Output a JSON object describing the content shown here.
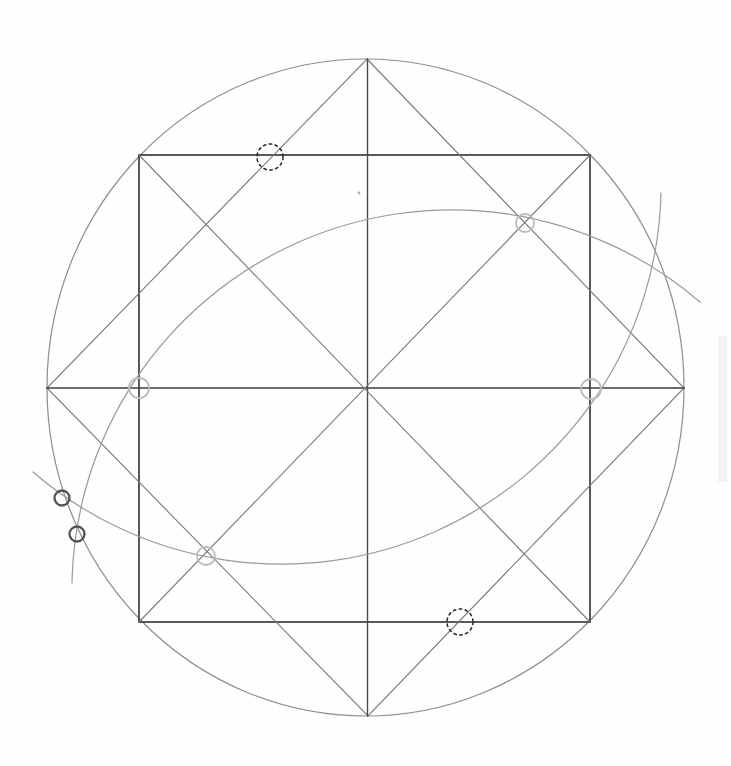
{
  "meta": {
    "canvas": {
      "width": 731,
      "height": 766,
      "background": "#fefefe"
    }
  },
  "palette": {
    "square_stroke": "#3c3c3c",
    "diameter_stroke": "#454545",
    "diagonal_stroke": "#7a7a7a",
    "circle_stroke": "#8e8e8e",
    "arc_stroke": "#9a9a9a",
    "dotted_marker": "#2a2a2a",
    "gray_marker": "#bcbcbc",
    "dark_marker": "#515151",
    "stray_dot": "#b0b0b0",
    "scan_streak": "#dcdcdc"
  },
  "diagram": {
    "outer_circle": {
      "name": "outer-circle",
      "cx": 365.5,
      "cy": 387.5,
      "rx": 318.5,
      "ry": 328.5,
      "stroke": "#8e8e8e",
      "width": 1.2
    },
    "inscribed_square": {
      "name": "inscribed-square",
      "x": 139,
      "y": 155,
      "w": 451,
      "h": 467,
      "stroke": "#3c3c3c",
      "width": 1.7
    },
    "diamond": {
      "name": "inscribed-diamond",
      "points": [
        [
          367,
          59
        ],
        [
          684,
          388
        ],
        [
          368,
          716
        ],
        [
          47,
          388
        ]
      ],
      "stroke": "#7a7a7a",
      "width": 1.1
    },
    "lines": [
      {
        "name": "vertical-diameter",
        "x1": 367.5,
        "y1": 59,
        "x2": 367.5,
        "y2": 716,
        "stroke": "#4a4a4a",
        "width": 1.4
      },
      {
        "name": "horizontal-diameter",
        "x1": 47,
        "y1": 388,
        "x2": 684,
        "y2": 388,
        "stroke": "#3d3d3d",
        "width": 1.7
      },
      {
        "name": "square-diagonal-tlbr",
        "x1": 139,
        "y1": 155,
        "x2": 590,
        "y2": 622,
        "stroke": "#7a7a7a",
        "width": 1.1
      },
      {
        "name": "square-diagonal-trbl",
        "x1": 590,
        "y1": 155,
        "x2": 139,
        "y2": 622,
        "stroke": "#7a7a7a",
        "width": 1.1
      }
    ],
    "arcs": [
      {
        "name": "construction-arc-upper",
        "start": [
          72,
          583
        ],
        "end": [
          700,
          302
        ],
        "radius": 380,
        "large": 0,
        "sweep": 1,
        "stroke": "#9a9a9a",
        "width": 1.2
      },
      {
        "name": "construction-arc-lower",
        "start": [
          33,
          472
        ],
        "end": [
          661,
          193
        ],
        "radius": 380,
        "large": 0,
        "sweep": 0,
        "stroke": "#9a9a9a",
        "width": 1.2
      }
    ],
    "markers": {
      "dotted": {
        "stroke": "#2a2a2a",
        "width": 1.5,
        "dash": "2.6 3.4",
        "items": [
          {
            "name": "dotted-marker-top-edge",
            "cx": 270,
            "cy": 157,
            "r": 13
          },
          {
            "name": "dotted-marker-bottom-edge",
            "cx": 460,
            "cy": 622,
            "r": 13
          }
        ]
      },
      "gray": {
        "stroke": "#bcbcbc",
        "width": 1.8,
        "items": [
          {
            "name": "gray-marker-upper-right-star-point",
            "cx": 525,
            "cy": 223,
            "r": 9
          },
          {
            "name": "gray-marker-left-midline",
            "cx": 139,
            "cy": 388,
            "r": 10
          },
          {
            "name": "gray-marker-right-midline",
            "cx": 591,
            "cy": 389,
            "r": 10
          },
          {
            "name": "gray-marker-lower-left-star-point",
            "cx": 206,
            "cy": 556,
            "r": 9
          }
        ]
      },
      "dark": {
        "stroke": "#515151",
        "width": 2.3,
        "items": [
          {
            "name": "dark-marker-circle-crossing-1",
            "cx": 62,
            "cy": 498,
            "r": 7.5
          },
          {
            "name": "dark-marker-circle-crossing-2",
            "cx": 77,
            "cy": 534,
            "r": 7.5
          }
        ]
      }
    },
    "stray_dot": {
      "name": "stray-pencil-dot",
      "cx": 359,
      "cy": 193,
      "r": 1.4,
      "fill": "#b0b0b0"
    },
    "scan_streaks": [
      {
        "name": "scan-streak-right-edge",
        "x": 718,
        "y": 336,
        "w": 9,
        "h": 146,
        "fill": "#dcdcdc",
        "opacity": 0.35
      }
    ]
  }
}
